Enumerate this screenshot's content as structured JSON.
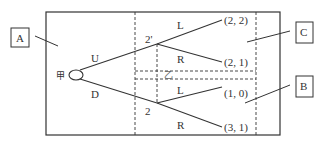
{
  "diagram": {
    "type": "game-tree",
    "callouts": [
      {
        "id": "A",
        "label": "A"
      },
      {
        "id": "C",
        "label": "C"
      },
      {
        "id": "B",
        "label": "B"
      }
    ],
    "nodes": {
      "root": {
        "label": "甲"
      },
      "upper": {
        "label": "2'"
      },
      "lower": {
        "label": "2"
      },
      "info_set": {
        "label": "乙"
      }
    },
    "edges": {
      "root_up": "U",
      "root_down": "D",
      "upper_left": "L",
      "upper_right": "R",
      "lower_left": "L",
      "lower_right": "R"
    },
    "payoffs": [
      "(2, 2)",
      "(2, 1)",
      "(1, 0)",
      "(3, 1)"
    ]
  }
}
